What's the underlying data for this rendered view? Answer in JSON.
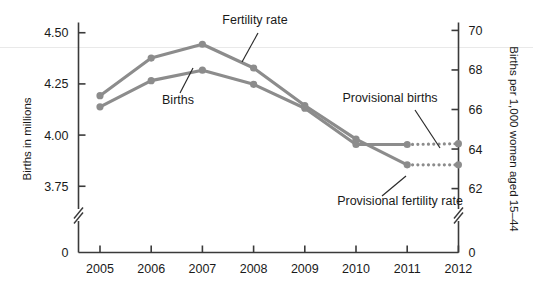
{
  "chart_data": {
    "type": "line",
    "title": "",
    "subtitle": "",
    "x": [
      2005,
      2006,
      2007,
      2008,
      2009,
      2010,
      2011,
      2012
    ],
    "categories": [
      "2005",
      "2006",
      "2007",
      "2008",
      "2009",
      "2010",
      "2011",
      "2012"
    ],
    "xlabel": "",
    "ylabel": "Births in millions",
    "y2label": "Births per 1,000 women aged 15–44",
    "ylim": [
      3.7,
      4.55
    ],
    "y2lim": [
      61.6,
      70.4
    ],
    "ytick_labels": [
      "4.50",
      "4.25",
      "4.00",
      "3.75",
      "0"
    ],
    "ytick_values": [
      4.5,
      4.25,
      4.0,
      3.75,
      0
    ],
    "y2tick_labels": [
      "70",
      "68",
      "66",
      "64",
      "62",
      "0"
    ],
    "y2tick_values": [
      70,
      68,
      66,
      64,
      62,
      0
    ],
    "axis_break": true,
    "grid": false,
    "legend_position": "inline-annotations",
    "series": [
      {
        "name": "Births",
        "axis": "left",
        "units": "millions",
        "color": "#8c8c8c",
        "solid_x": [
          2005,
          2006,
          2007,
          2008,
          2009,
          2010,
          2011
        ],
        "solid_values": [
          4.138,
          4.266,
          4.317,
          4.248,
          4.131,
          3.954,
          3.954
        ],
        "values": [
          4.138,
          4.266,
          4.317,
          4.248,
          4.131,
          3.954,
          3.954,
          3.958
        ]
      },
      {
        "name": "Fertility rate",
        "axis": "right",
        "units": "per 1,000 women aged 15-44",
        "color": "#8c8c8c",
        "solid_x": [
          2005,
          2006,
          2007,
          2008,
          2009,
          2010,
          2011
        ],
        "solid_values": [
          66.7,
          68.6,
          69.3,
          68.1,
          66.2,
          64.5,
          63.2
        ],
        "values": [
          66.7,
          68.6,
          69.3,
          68.1,
          66.2,
          64.5,
          63.2,
          63.2
        ]
      }
    ],
    "provisional_segments": [
      {
        "name": "Provisional births",
        "axis": "left",
        "from_x": 2011,
        "to_x": 2012,
        "from_value": 3.954,
        "to_value": 3.958,
        "style": "dotted"
      },
      {
        "name": "Provisional fertility rate",
        "axis": "right",
        "from_x": 2011,
        "to_x": 2012,
        "from_value": 63.2,
        "to_value": 63.2,
        "style": "dotted"
      }
    ],
    "annotations": [
      {
        "id": "fertility-rate",
        "text": "Fertility rate",
        "x": 255,
        "y": 24
      },
      {
        "id": "births",
        "text": "Births",
        "x": 178,
        "y": 104
      },
      {
        "id": "provisional-births",
        "text": "Provisional births",
        "x": 390,
        "y": 102
      },
      {
        "id": "provisional-fertility-rate",
        "text": "Provisional fertility rate",
        "x": 400,
        "y": 205
      }
    ],
    "colors": {
      "line": "#8c8c8c",
      "marker": "#8c8c8c",
      "axis": "#3a3a3a",
      "text": "#1a1a1a",
      "background": "#ffffff"
    }
  },
  "axes": {
    "left": {
      "title": "Births in millions",
      "ticks": [
        "4.50",
        "4.25",
        "4.00",
        "3.75",
        "0"
      ]
    },
    "right": {
      "title": "Births per 1,000 women aged 15–44",
      "ticks": [
        "70",
        "68",
        "66",
        "64",
        "62",
        "0"
      ]
    },
    "bottom": {
      "ticks": [
        "2005",
        "2006",
        "2007",
        "2008",
        "2009",
        "2010",
        "2011",
        "2012"
      ]
    }
  },
  "annotations": {
    "fertility_rate": "Fertility rate",
    "births": "Births",
    "provisional_births": "Provisional births",
    "provisional_fertility_rate": "Provisional fertility rate"
  }
}
